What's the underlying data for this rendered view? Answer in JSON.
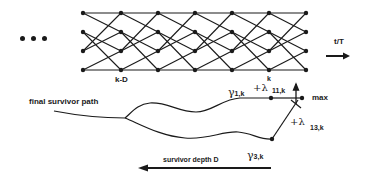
{
  "diagram": {
    "type": "viterbi-trellis",
    "ellipsis": "...",
    "trellis": {
      "states": 4,
      "columns_x": [
        83,
        121,
        158,
        195,
        232,
        269,
        306
      ],
      "rows_y": [
        13,
        32,
        51,
        70
      ],
      "column_label_left": "k-D",
      "column_label_right": "k"
    },
    "time_axis": {
      "label": "t/T"
    },
    "labels": {
      "final_survivor_path": "final survivor path",
      "gamma_1": "γ",
      "gamma_1_sub": "1,k",
      "plus_lambda_11": "+λ",
      "lambda_11_sup": "k",
      "lambda_11_sub": "11,k",
      "max": "max",
      "plus_lambda_13": "+λ",
      "lambda_13_sub": "13,k",
      "gamma_3": "γ",
      "gamma_3_sub": "3,k",
      "survivor_depth": "survivor depth D"
    },
    "colors": {
      "ink": "#1a1a1a",
      "background": "#ffffff"
    }
  }
}
